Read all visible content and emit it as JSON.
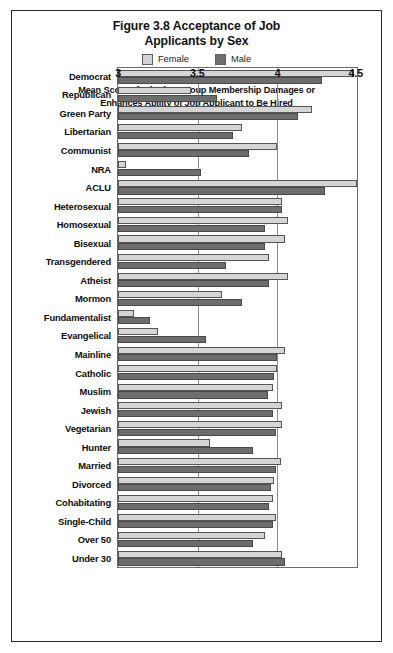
{
  "figure": {
    "title_line1": "Figure 3.8 Acceptance of Job",
    "title_line2": "Applicants by Sex",
    "caption_line1": "Mean Score of Whether Group Membership Damages or",
    "caption_line2": "Enhances Ability of Job Applicant to Be Hired"
  },
  "legend": {
    "female_label": "Female",
    "male_label": "Male",
    "female_color": "#d5d5d5",
    "male_color": "#6d6d6d"
  },
  "chart_data": {
    "type": "bar",
    "orientation": "horizontal",
    "title": "Figure 3.8 Acceptance of Job Applicants by Sex",
    "xlabel": "Mean Score of Whether Group Membership Damages or Enhances Ability of Job Applicant to Be Hired",
    "ylabel": "",
    "xlim": [
      3,
      4.5
    ],
    "xticks": [
      3,
      3.5,
      4,
      4.5
    ],
    "xtick_labels": [
      "3",
      "3.5",
      "4",
      "4.5"
    ],
    "gridlines": [
      3.5,
      4
    ],
    "grid": true,
    "legend_position": "top-center",
    "categories": [
      "Democrat",
      "Republican",
      "Green Party",
      "Libertarian",
      "Communist",
      "NRA",
      "ACLU",
      "Heterosexual",
      "Homosexual",
      "Bisexual",
      "Transgendered",
      "Atheist",
      "Mormon",
      "Fundamentalist",
      "Evangelical",
      "Mainline",
      "Catholic",
      "Muslim",
      "Jewish",
      "Vegetarian",
      "Hunter",
      "Married",
      "Divorced",
      "Cohabitating",
      "Single-Child",
      "Over 50",
      "Under 30"
    ],
    "series": [
      {
        "name": "Female",
        "color": "#d5d5d5",
        "values": [
          4.48,
          3.46,
          4.22,
          3.78,
          4.0,
          3.05,
          4.5,
          4.03,
          4.07,
          4.05,
          3.95,
          4.07,
          3.65,
          3.1,
          3.25,
          4.05,
          4.0,
          3.97,
          4.03,
          4.03,
          3.58,
          4.02,
          3.98,
          3.97,
          3.99,
          3.92,
          4.03
        ]
      },
      {
        "name": "Male",
        "color": "#6d6d6d",
        "values": [
          4.28,
          3.62,
          4.13,
          3.72,
          3.82,
          3.52,
          4.3,
          4.03,
          3.92,
          3.92,
          3.68,
          3.95,
          3.78,
          3.2,
          3.55,
          4.0,
          3.98,
          3.94,
          3.97,
          3.99,
          3.85,
          3.99,
          3.96,
          3.95,
          3.97,
          3.85,
          4.05
        ]
      }
    ]
  }
}
